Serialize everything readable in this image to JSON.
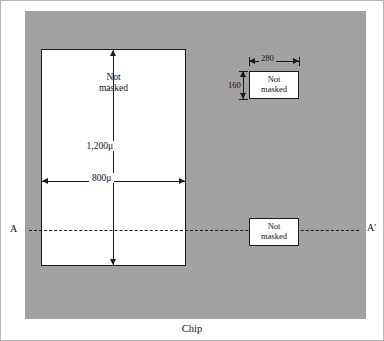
{
  "figure": {
    "caption": "Chip",
    "colors": {
      "masked_substrate": "#a2a2a2",
      "unmasked_window": "#ffffff",
      "line": "#1a1a1a"
    }
  },
  "regions": {
    "large_window": {
      "label_line1": "Not",
      "label_line2": "masked"
    },
    "small_window": {
      "label_line1": "Not",
      "label_line2": "masked"
    },
    "section_window": {
      "label_line1": "Not",
      "label_line2": "masked"
    }
  },
  "dimensions": {
    "large_height": "1,200μ",
    "large_width": "800μ",
    "small_width": "280",
    "small_height": "160"
  },
  "section_line": {
    "start_label": "A",
    "end_label": "A′"
  }
}
